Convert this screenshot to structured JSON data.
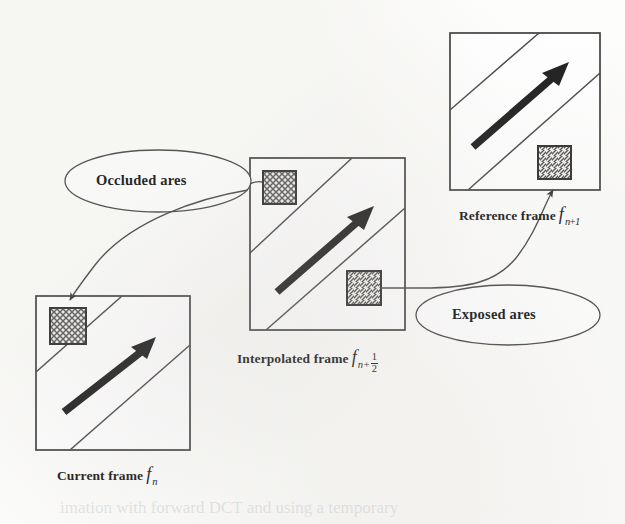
{
  "figure": {
    "type": "diagram",
    "background_color": "#fdfdfb",
    "line_color": "#3a3a3a",
    "arrow_color": "#1a1a1a"
  },
  "frames": [
    {
      "id": "current-frame",
      "caption_text": "Current frame",
      "symbol": "f",
      "subscript": "n",
      "rect": {
        "x": 36,
        "y": 296,
        "w": 154,
        "h": 154
      },
      "caption_pos": {
        "x": 57,
        "y": 466
      },
      "region": {
        "id": "occluded-region-current",
        "kind": "crosshatch",
        "x": 50,
        "y": 308,
        "w": 36,
        "h": 36
      },
      "motion_arrow": {
        "x1": 64,
        "y1": 412,
        "x2": 152,
        "y2": 344
      },
      "object_lines": [
        {
          "x1": 36,
          "y1": 372,
          "x2": 122,
          "y2": 296
        },
        {
          "x1": 70,
          "y1": 450,
          "x2": 190,
          "y2": 345
        }
      ]
    },
    {
      "id": "interpolated-frame",
      "caption_text": "Interpolated frame",
      "symbol": "f",
      "subscript_base": "n+",
      "subscript_fraction_numerator": "1",
      "subscript_fraction_denominator": "2",
      "rect": {
        "x": 250,
        "y": 158,
        "w": 155,
        "h": 172
      },
      "caption_pos": {
        "x": 237,
        "y": 349
      },
      "regions": [
        {
          "id": "occluded-region-interpolated",
          "kind": "crosshatch",
          "x": 263,
          "y": 171,
          "w": 33,
          "h": 33
        },
        {
          "id": "exposed-region-interpolated",
          "kind": "hatch",
          "x": 347,
          "y": 271,
          "w": 34,
          "h": 34
        }
      ],
      "motion_arrow": {
        "x1": 277,
        "y1": 292,
        "x2": 371,
        "y2": 212
      },
      "object_lines": [
        {
          "x1": 250,
          "y1": 253,
          "x2": 352,
          "y2": 158
        },
        {
          "x1": 266,
          "y1": 330,
          "x2": 405,
          "y2": 208
        }
      ]
    },
    {
      "id": "reference-frame",
      "caption_text": "Reference frame",
      "symbol": "f",
      "subscript": "n+1",
      "rect": {
        "x": 450,
        "y": 33,
        "w": 150,
        "h": 157
      },
      "caption_pos": {
        "x": 459,
        "y": 206
      },
      "region": {
        "id": "exposed-region-reference",
        "kind": "hatch",
        "x": 538,
        "y": 146,
        "w": 33,
        "h": 33
      },
      "motion_arrow": {
        "x1": 473,
        "y1": 147,
        "x2": 566,
        "y2": 66
      },
      "object_lines": [
        {
          "x1": 450,
          "y1": 110,
          "x2": 539,
          "y2": 33
        },
        {
          "x1": 468,
          "y1": 190,
          "x2": 600,
          "y2": 73
        }
      ]
    }
  ],
  "callouts": [
    {
      "id": "occluded-callout",
      "label": "Occluded ares",
      "ellipse": {
        "cx": 158,
        "cy": 181,
        "rx": 93,
        "ry": 31
      },
      "label_pos": {
        "x": 96,
        "y": 174
      },
      "leader": {
        "from": {
          "x": 245,
          "y": 189
        },
        "to": {
          "x": 68,
          "y": 305
        },
        "has_arrowhead": true
      }
    },
    {
      "id": "exposed-callout",
      "label": "Exposed ares",
      "ellipse": {
        "cx": 508,
        "cy": 315,
        "rx": 92,
        "ry": 30
      },
      "label_pos": {
        "x": 452,
        "y": 308
      },
      "leader": {
        "from": {
          "x": 420,
          "y": 288
        },
        "to": {
          "x": 553,
          "y": 184
        },
        "has_arrowhead": true
      }
    }
  ],
  "bleed_text": {
    "line1": "imation with forward DCT and using a temporary",
    "line2": ""
  }
}
